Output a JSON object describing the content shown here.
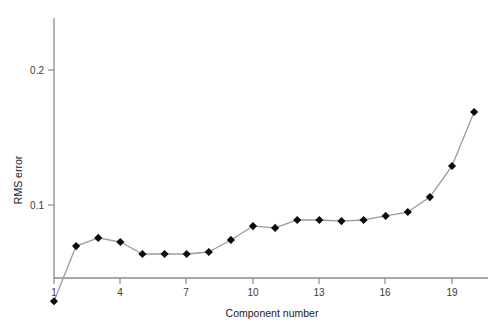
{
  "chart_data": {
    "type": "line",
    "title": "",
    "xlabel": "Component number",
    "ylabel": "RMS error",
    "x": [
      1,
      2,
      3,
      4,
      5,
      6,
      7,
      8,
      9,
      10,
      11,
      12,
      13,
      14,
      15,
      16,
      17,
      18,
      19,
      20
    ],
    "values": [
      0.0287,
      0.0696,
      0.0756,
      0.0726,
      0.0637,
      0.0637,
      0.0637,
      0.0652,
      0.0741,
      0.0844,
      0.083,
      0.0889,
      0.0889,
      0.0881,
      0.0889,
      0.0919,
      0.0948,
      0.1059,
      0.1289,
      0.1689
    ],
    "xticks": [
      1,
      4,
      7,
      10,
      13,
      16,
      19
    ],
    "xtick_labels": [
      "1",
      "4",
      "7",
      "10",
      "13",
      "16",
      "19"
    ],
    "yticks": [
      0.1,
      0.2
    ],
    "ytick_labels": [
      "0.1",
      "0.2"
    ],
    "xlim": [
      1,
      20.3
    ],
    "ylim": [
      0.0287,
      0.2222
    ],
    "grid": false,
    "legend": null,
    "marker": "diamond",
    "marker_color": "#0d0d0d",
    "line_color": "#9a9a9a",
    "axis_color": "#8a8a8a",
    "background": "#ffffff"
  },
  "axes": {
    "x_title": "Component number",
    "y_title": "RMS error"
  }
}
